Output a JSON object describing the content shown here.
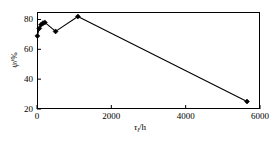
{
  "chart_data": {
    "type": "line",
    "title": "",
    "xlabel": "τ₁/h",
    "ylabel": "ψ/%",
    "xlabel_symbol": "τ",
    "xlabel_sub": "l",
    "xlabel_unit": "/h",
    "ylabel_symbol": "ψ",
    "ylabel_unit": "/%",
    "xlim": [
      0,
      6000
    ],
    "ylim": [
      20,
      85
    ],
    "xticks": [
      0,
      2000,
      4000,
      6000
    ],
    "yticks": [
      20,
      40,
      60,
      80
    ],
    "xtick_labels": [
      "0",
      "2000",
      "4000",
      "6000"
    ],
    "ytick_labels": [
      "20",
      "40",
      "60",
      "80"
    ],
    "grid": false,
    "legend": null,
    "marker": "filled-diamond",
    "line_color": "#000000",
    "marker_color": "#000000",
    "series": [
      {
        "name": "psi vs tau_l",
        "x": [
          10,
          60,
          110,
          160,
          210,
          500,
          1100,
          5650
        ],
        "y": [
          69,
          74,
          76.5,
          77.5,
          78,
          72,
          82,
          25
        ]
      }
    ]
  },
  "figure": {
    "background": "#ffffff",
    "frame_color": "#000000"
  }
}
